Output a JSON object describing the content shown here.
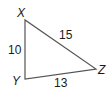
{
  "diagram": {
    "type": "triangle",
    "vertices": {
      "X": {
        "label": "X",
        "x": 25,
        "y": 20
      },
      "Y": {
        "label": "Y",
        "x": 25,
        "y": 79
      },
      "Z": {
        "label": "Z",
        "x": 96,
        "y": 69
      }
    },
    "sides": {
      "XY": {
        "label": "10"
      },
      "XZ": {
        "label": "15"
      },
      "YZ": {
        "label": "13"
      }
    },
    "stroke_color": "#555555",
    "text_color": "#1a1a1a"
  }
}
